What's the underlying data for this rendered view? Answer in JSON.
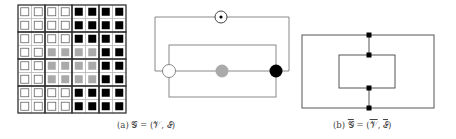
{
  "figure": {
    "subfigures": [
      {
        "id": "a",
        "caption": "(a) 𝒢 = (𝒱, ℰ)",
        "grid": {
          "rows": 8,
          "cols": 8,
          "cells": [
            [
              "w",
              "w",
              "w",
              "w",
              "b",
              "b",
              "b",
              "b"
            ],
            [
              "w",
              "w",
              "w",
              "w",
              "b",
              "b",
              "b",
              "b"
            ],
            [
              "w",
              "w",
              "w",
              "w",
              "b",
              "b",
              "b",
              "b"
            ],
            [
              "w",
              "w",
              "g",
              "g",
              "g",
              "g",
              "b",
              "b"
            ],
            [
              "w",
              "w",
              "g",
              "g",
              "g",
              "g",
              "b",
              "b"
            ],
            [
              "w",
              "w",
              "g",
              "g",
              "g",
              "g",
              "b",
              "b"
            ],
            [
              "w",
              "w",
              "w",
              "w",
              "b",
              "b",
              "b",
              "b"
            ],
            [
              "w",
              "w",
              "w",
              "w",
              "b",
              "b",
              "b",
              "b"
            ]
          ]
        },
        "graph": {
          "nodes": [
            {
              "id": "top",
              "type": "dot-in-circle"
            },
            {
              "id": "white",
              "fill": "#ffffff"
            },
            {
              "id": "gray",
              "fill": "#aaaaaa"
            },
            {
              "id": "black",
              "fill": "#000000"
            }
          ]
        }
      },
      {
        "id": "b",
        "caption": "(b) ̅𝒢 = (̅𝒱, ̅ℰ)",
        "caption_parts": {
          "label": "(b)",
          "lhs": "𝒢",
          "v": "𝒱",
          "e": "ℰ"
        }
      }
    ],
    "captions": {
      "a_label": "(a)",
      "a_formula": "𝒢 = (𝒱, ℰ)",
      "b_label": "(b)",
      "b_formula_g": "𝒢",
      "b_formula_eq": " = (",
      "b_formula_v": "𝒱",
      "b_formula_comma": ", ",
      "b_formula_e": "ℰ",
      "b_formula_close": ")"
    },
    "colors": {
      "line": "#888888",
      "black": "#000000",
      "gray": "#aaaaaa",
      "white": "#ffffff"
    }
  }
}
